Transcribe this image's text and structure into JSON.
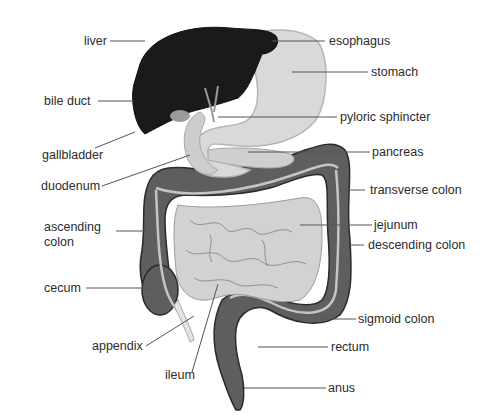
{
  "diagram": {
    "colors": {
      "liver": "#1a1a1a",
      "stomach": "#d9d9d9",
      "outline": "#b5b5b5",
      "colon": "#5e5e5e",
      "colon_outline": "#2a2a2a",
      "small_intestine": "#cfcfcf",
      "leader_line": "#555555",
      "label_text": "#2b2b2b"
    },
    "labels": {
      "liver": "liver",
      "bile_duct": "bile duct",
      "gallbladder": "gallbladder",
      "duodenum": "duodenum",
      "ascending_colon_1": "ascending",
      "ascending_colon_2": "colon",
      "cecum": "cecum",
      "appendix": "appendix",
      "ileum": "ileum",
      "esophagus": "esophagus",
      "stomach": "stomach",
      "pyloric_sphincter": "pyloric sphincter",
      "pancreas": "pancreas",
      "transverse_colon": "transverse colon",
      "jejunum": "jejunum",
      "descending_colon": "descending colon",
      "sigmoid_colon": "sigmoid colon",
      "rectum": "rectum",
      "anus": "anus"
    }
  }
}
